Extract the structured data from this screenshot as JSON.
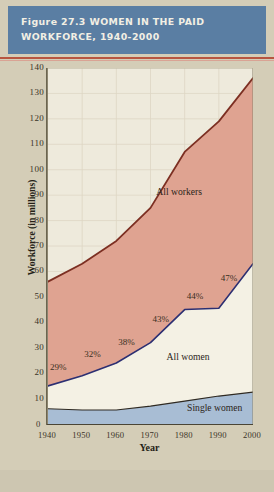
{
  "figure": {
    "header_title": "Figure 27.3 WOMEN IN THE PAID\nWORKFORCE, 1940-2000",
    "colors": {
      "header_bg": "#5a7ea3",
      "page_bg": "#d4cdb7",
      "plot_bg": "#eeeadc",
      "all_workers_fill": "#dfa391",
      "all_workers_line": "#7c2f22",
      "all_women_fill": "#f4f1e4",
      "all_women_line": "#2c2f72",
      "single_women_fill": "#a8bdd4",
      "single_women_line": "#2f2a22",
      "rule_red": "#b8553f"
    }
  },
  "chart_data": {
    "type": "area",
    "title": "Figure 27.3 WOMEN IN THE PAID WORKFORCE, 1940-2000",
    "xlabel": "Year",
    "ylabel": "Workforce (in millions)",
    "x": [
      1940,
      1950,
      1960,
      1970,
      1980,
      1990,
      2000
    ],
    "xtick_labels": [
      "1940",
      "1950",
      "1960",
      "1970",
      "1980",
      "1990",
      "2000"
    ],
    "ytick_labels": [
      "0",
      "10",
      "20",
      "30",
      "40",
      "50",
      "60",
      "70",
      "80",
      "90",
      "100",
      "110",
      "120",
      "130",
      "140"
    ],
    "ylim": [
      0,
      140
    ],
    "xlim": [
      1940,
      2000
    ],
    "grid": true,
    "legend_position": "in-plot",
    "stacking": "overlay",
    "series": [
      {
        "name": "All workers",
        "values": [
          56,
          63,
          72,
          85,
          107,
          119,
          136
        ],
        "label_x": 1972,
        "label_y": 91
      },
      {
        "name": "All women",
        "values": [
          15,
          19,
          24,
          32,
          45,
          45.5,
          63
        ],
        "label_x": 1975,
        "label_y": 26
      },
      {
        "name": "Single women",
        "values": [
          6,
          5.5,
          5.5,
          7,
          9,
          11,
          12.5
        ],
        "label_x": 1981,
        "label_y": 6
      }
    ],
    "annotations": [
      {
        "text": "29%",
        "x": 1940,
        "y": 22
      },
      {
        "text": "32%",
        "x": 1950,
        "y": 27
      },
      {
        "text": "38%",
        "x": 1960,
        "y": 32
      },
      {
        "text": "43%",
        "x": 1970,
        "y": 41
      },
      {
        "text": "44%",
        "x": 1980,
        "y": 50
      },
      {
        "text": "47%",
        "x": 1990,
        "y": 57
      }
    ]
  }
}
